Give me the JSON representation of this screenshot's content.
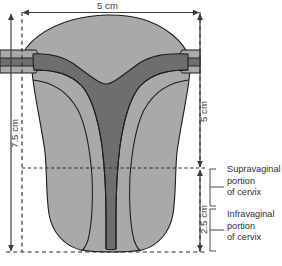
{
  "figure": {
    "title_text": "",
    "background_color": "#ffffff",
    "organ": "uterus midline coronal section",
    "colors": {
      "outline": "#1c1c1c",
      "myometrium_fill": "#a9a9a9",
      "cavity_fill": "#6e6e6e",
      "dimension_line": "#3b3b3b",
      "dashed_guide": "#2b2b2b",
      "bracket": "#4a4a4a",
      "label_text": "#2e2e2e"
    },
    "dimensions": [
      {
        "name": "width-overall",
        "value": "5 cm",
        "orientation": "horizontal",
        "position": "top"
      },
      {
        "name": "height-overall",
        "value": "7.5 cm",
        "orientation": "vertical",
        "position": "left"
      },
      {
        "name": "body-height",
        "value": "5 cm",
        "orientation": "vertical",
        "position": "right-inner"
      },
      {
        "name": "cervix-height",
        "value": "2.5 cm",
        "orientation": "vertical",
        "position": "right-lower"
      }
    ],
    "callouts": [
      {
        "name": "supravaginal-portion",
        "lines": [
          "Supravaginal",
          "portion",
          "of cervix"
        ]
      },
      {
        "name": "infravaginal-portion",
        "lines": [
          "Infravaginal",
          "portion",
          "of cervix"
        ]
      }
    ]
  }
}
